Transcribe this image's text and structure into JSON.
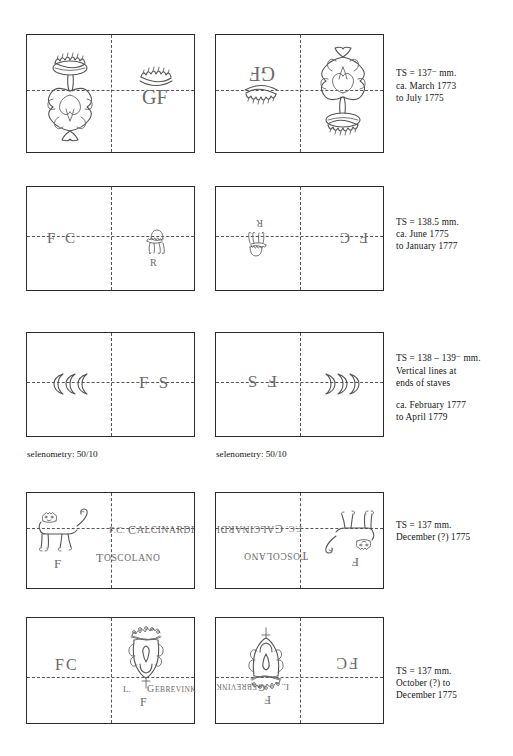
{
  "page": {
    "type": "watermark-catalogue-plate",
    "rows": [
      {
        "id": "row-1",
        "left_sheet": {
          "label": "recto",
          "marks": [
            "crowned-fleur-shield",
            "GF"
          ]
        },
        "right_sheet": {
          "label": "verso-mirrored",
          "marks": [
            "GF-mirrored",
            "crowned-fleur-shield-mirrored"
          ]
        },
        "description": {
          "ts_prefix": "TS = 137",
          "ts_sup": "−",
          "ts_unit": "mm.",
          "lines": [
            "ca. March 1773",
            "to July 1775"
          ]
        }
      },
      {
        "id": "row-2",
        "left_sheet": {
          "label": "recto",
          "marks": [
            "F C",
            "crown-R"
          ]
        },
        "right_sheet": {
          "label": "verso-mirrored",
          "marks": [
            "crown-R-mirrored",
            "F C-mirrored"
          ]
        },
        "description": {
          "ts_prefix": "TS = 138.5 mm.",
          "ts_sup": "",
          "ts_unit": "",
          "lines": [
            "ca. June 1775",
            "to January 1777"
          ]
        }
      },
      {
        "id": "row-3",
        "left_sheet": {
          "label": "recto",
          "marks": [
            "three-crescents",
            "F S"
          ]
        },
        "right_sheet": {
          "label": "verso-mirrored",
          "marks": [
            "F S-mirrored",
            "three-crescents-mirrored"
          ]
        },
        "description": {
          "ts_prefix": "TS = 138 – 139",
          "ts_sup": "−",
          "ts_unit": "mm.",
          "lines": [
            "Vertical lines at",
            "ends of staves"
          ],
          "lines2": [
            "ca. February 1777",
            "to April 1779"
          ]
        },
        "seleno_left": "selenometry: 50/10",
        "seleno_right": "selenometry: 50/10"
      },
      {
        "id": "row-4",
        "left_sheet": {
          "label": "recto",
          "marks": [
            "lion-rampant",
            "F",
            "F.C. CALCINARDI",
            "TOSCOLANO"
          ]
        },
        "right_sheet": {
          "label": "verso-mirrored",
          "marks": [
            "CALCINARDI-mirrored",
            "TOSCOLANO-mirrored",
            "lion-rampant-mirrored",
            "F-mirrored"
          ]
        },
        "description": {
          "ts_prefix": "TS = 137 mm.",
          "ts_sup": "",
          "ts_unit": "",
          "lines": [
            "December (?) 1775"
          ]
        }
      },
      {
        "id": "row-5",
        "left_sheet": {
          "label": "recto",
          "marks": [
            "FC",
            "crowned-shield-posthorn",
            "L. V GEBREVINK",
            "F"
          ]
        },
        "right_sheet": {
          "label": "verso-mirrored",
          "marks": [
            "crowned-shield-posthorn-mirrored",
            "L. V GEBREVINK-mirrored",
            "F-mirrored",
            "FC-mirrored"
          ]
        },
        "description": {
          "ts_prefix": "TS = 137 mm.",
          "ts_sup": "",
          "ts_unit": "",
          "lines": [
            "October (?) to",
            "December 1775"
          ]
        }
      }
    ],
    "watermark_text": {
      "gf": "GF",
      "fc_spaced": "F C",
      "fs_spaced": "F S",
      "r": "R",
      "f": "F",
      "fc": "FC",
      "calcinardi": "CALCINARDI",
      "calcinardi_prefix": "F.C.",
      "toscolano": "TOSCOLANO",
      "gebrevink": "GEBREVINK",
      "gebrevink_prefix": "L.",
      "gebrevink_mid": "V"
    }
  }
}
